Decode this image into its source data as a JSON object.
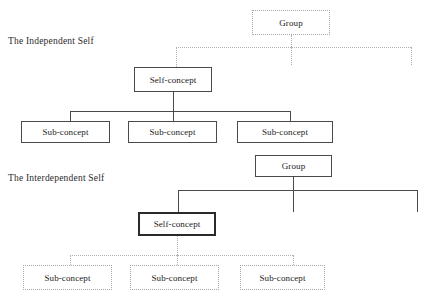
{
  "diagram": {
    "title_independent": "The Independent Self",
    "title_interdependent": "The Interdependent Self",
    "colors": {
      "solid_stroke": "#4a4a4a",
      "bold_stroke": "#2a2a2a",
      "dotted_stroke": "#b0b0b0",
      "text": "#1a1a1a",
      "background": "#ffffff"
    }
  },
  "independent_self": {
    "label": "The Independent Self",
    "group": {
      "label": "Group",
      "style": "dotted"
    },
    "self_concept": {
      "label": "Self-concept",
      "style": "solid"
    },
    "sub_concepts": [
      {
        "label": "Sub-concept",
        "style": "solid"
      },
      {
        "label": "Sub-concept",
        "style": "solid"
      },
      {
        "label": "Sub-concept",
        "style": "solid"
      }
    ],
    "group_links_style": "dotted",
    "self_links_style": "solid"
  },
  "interdependent_self": {
    "label": "The Interdependent Self",
    "group": {
      "label": "Group",
      "style": "solid"
    },
    "self_concept": {
      "label": "Self-concept",
      "style": "solid-bold"
    },
    "sub_concepts": [
      {
        "label": "Sub-concept",
        "style": "dotted"
      },
      {
        "label": "Sub-concept",
        "style": "dotted"
      },
      {
        "label": "Sub-concept",
        "style": "dotted"
      }
    ],
    "group_links_style": "solid",
    "self_links_style": "dotted"
  }
}
